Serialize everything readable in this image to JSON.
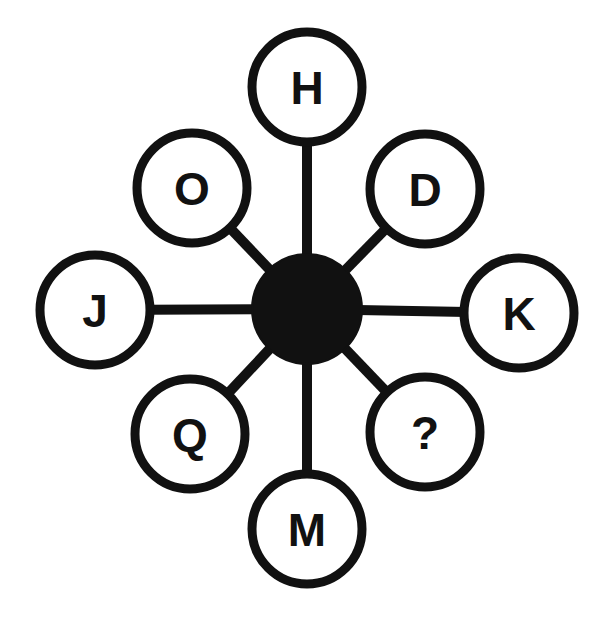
{
  "diagram": {
    "type": "radial-hub-and-spoke",
    "background_color": "#ffffff",
    "line_color": "#111111",
    "node_fill_color": "#ffffff",
    "hub_fill_color": "#111111",
    "hub": {
      "label": "",
      "cx": 307,
      "cy": 309,
      "r": 55,
      "filled": true
    },
    "node_radius": 55,
    "stroke_width": 9,
    "spoke_width": 10,
    "nodes": [
      {
        "id": "node-h",
        "label": "H",
        "cx": 307,
        "cy": 87,
        "angle_deg": 90,
        "position": "top"
      },
      {
        "id": "node-d",
        "label": "D",
        "cx": 425,
        "cy": 189,
        "angle_deg": 45,
        "position": "top-right"
      },
      {
        "id": "node-k",
        "label": "K",
        "cx": 519,
        "cy": 313,
        "angle_deg": 0,
        "position": "right"
      },
      {
        "id": "node-q2",
        "label": "?",
        "cx": 425,
        "cy": 432,
        "angle_deg": -45,
        "position": "bottom-right"
      },
      {
        "id": "node-m",
        "label": "M",
        "cx": 307,
        "cy": 529,
        "angle_deg": -90,
        "position": "bottom"
      },
      {
        "id": "node-q",
        "label": "Q",
        "cx": 190,
        "cy": 434,
        "angle_deg": -135,
        "position": "bottom-left"
      },
      {
        "id": "node-j",
        "label": "J",
        "cx": 95,
        "cy": 310,
        "angle_deg": 180,
        "position": "left"
      },
      {
        "id": "node-o",
        "label": "O",
        "cx": 192,
        "cy": 188,
        "angle_deg": 135,
        "position": "top-left"
      }
    ],
    "spokes": [
      {
        "id": "spoke-h",
        "from": "hub",
        "to": "node-h"
      },
      {
        "id": "spoke-d",
        "from": "hub",
        "to": "node-d"
      },
      {
        "id": "spoke-k",
        "from": "hub",
        "to": "node-k"
      },
      {
        "id": "spoke-q2",
        "from": "hub",
        "to": "node-q2"
      },
      {
        "id": "spoke-m",
        "from": "hub",
        "to": "node-m"
      },
      {
        "id": "spoke-q",
        "from": "hub",
        "to": "node-q"
      },
      {
        "id": "spoke-j",
        "from": "hub",
        "to": "node-j"
      },
      {
        "id": "spoke-o",
        "from": "hub",
        "to": "node-o"
      }
    ]
  }
}
